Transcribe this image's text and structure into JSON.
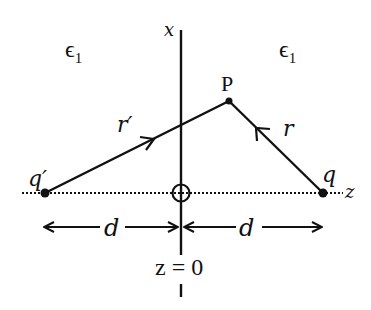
{
  "diagram": {
    "regions": [
      {
        "label": "ϵ",
        "subscript": "1",
        "side": "left"
      },
      {
        "label": "ϵ",
        "subscript": "1",
        "side": "right"
      }
    ],
    "axes": {
      "vertical_label": "x",
      "horizontal_label": "z",
      "origin_label": "z = 0"
    },
    "points": {
      "field_point": "P",
      "image_charge": "q′",
      "charge": "q"
    },
    "vectors": {
      "from_image": "r′",
      "from_charge": "r"
    },
    "distances": {
      "left": "d",
      "right": "d"
    },
    "colors": {
      "ink": "#111111",
      "background": "#ffffff"
    }
  }
}
